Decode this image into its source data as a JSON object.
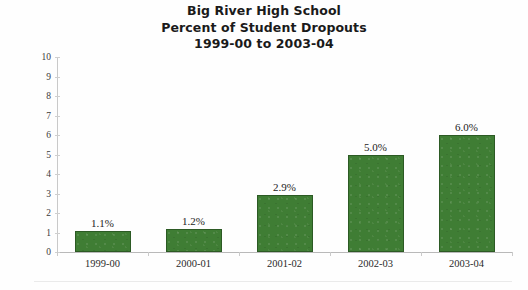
{
  "chart_data": {
    "type": "bar",
    "title": "Big River High School Percent of Student Dropouts 1999-00 to 2003-04",
    "title_lines": [
      "Big River High School",
      "Percent of Student Dropouts",
      "1999-00 to 2003-04"
    ],
    "categories": [
      "1999-00",
      "2000-01",
      "2001-02",
      "2002-03",
      "2003-04"
    ],
    "values": [
      1.1,
      1.2,
      2.9,
      5.0,
      6.0
    ],
    "value_labels": [
      "1.1%",
      "1.2%",
      "2.9%",
      "5.0%",
      "6.0%"
    ],
    "xlabel": "",
    "ylabel": "Percentage of Students",
    "ylim": [
      0,
      10
    ],
    "ytick_labels": [
      "10",
      "9",
      "8",
      "7",
      "6",
      "5",
      "4",
      "3",
      "2",
      "1",
      "0"
    ],
    "ytick_values": [
      10,
      9,
      8,
      7,
      6,
      5,
      4,
      3,
      2,
      1,
      0
    ],
    "grid": false,
    "legend": null,
    "series_color": "#3f7d34",
    "series_edge_color": "#2c5a24",
    "axis_color": "#c2c2c2",
    "text_color": "#232323",
    "background": "#fefefe"
  }
}
